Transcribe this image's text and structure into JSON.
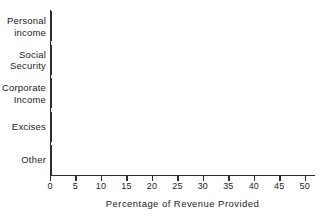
{
  "chart_data": {
    "type": "bar",
    "orientation": "horizontal",
    "title": "",
    "xlabel": "Percentage of Revenue Provided",
    "ylabel": "",
    "categories": [
      "Personal\nincome",
      "Social\nSecurity",
      "Corporate\nIncome",
      "Excises",
      "Other"
    ],
    "values": [
      43.3,
      31,
      16,
      5,
      5
    ],
    "xlim": [
      0,
      52
    ],
    "xticks": [
      0,
      5,
      10,
      15,
      20,
      25,
      30,
      35,
      40,
      45,
      50
    ],
    "xtick_labels": [
      "0",
      "5",
      "10",
      "15",
      "20",
      "25",
      "30",
      "35",
      "40",
      "45",
      "50"
    ],
    "grid": false,
    "legend": false,
    "bar_fill_color": "#a9a9a9",
    "bar_edge_color": "#2d2d2d",
    "axis_color": "#2b2b2b",
    "text_color": "#1d1d1d",
    "background_color": "#ffffff"
  }
}
